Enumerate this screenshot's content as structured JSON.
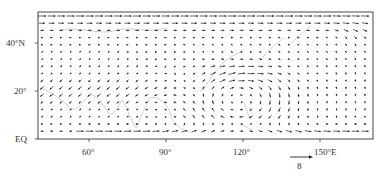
{
  "figure": {
    "type": "wind_vector_field_map",
    "frame": {
      "lon_min": 40,
      "lon_max": 170,
      "lat_min": 0,
      "lat_max": 53
    },
    "colors": {
      "vectors": "#222222",
      "coastline": "#b8b8b8",
      "frame": "#333333"
    }
  },
  "axes": {
    "y_ticks": [
      {
        "label": "40°N",
        "lat": 40
      },
      {
        "label": "20°",
        "lat": 20
      },
      {
        "label": "EQ",
        "lat": 0
      }
    ],
    "x_ticks": [
      {
        "label": "60°",
        "lon": 60
      },
      {
        "label": "90°",
        "lon": 90
      },
      {
        "label": "120°",
        "lon": 120
      },
      {
        "label": "150°E",
        "lon": 150
      }
    ]
  },
  "scale_vector": {
    "label": "8",
    "icon": "reference-arrow"
  },
  "chart_data": {
    "type": "quiver",
    "title": "",
    "xlabel": "Longitude",
    "ylabel": "Latitude",
    "xlim": [
      40,
      170
    ],
    "ylim": [
      0,
      53
    ],
    "x_ticks": [
      "60°",
      "90°",
      "120°",
      "150°E"
    ],
    "y_ticks": [
      "EQ",
      "20°",
      "40°N"
    ],
    "reference_vector": 8,
    "features": [
      {
        "name": "westerly jet",
        "region": "lat 45-53, all lon",
        "direction": "eastward",
        "magnitude": "strong"
      },
      {
        "name": "northeasterly flow",
        "region": "lat 15-30, lon 40-90",
        "direction": "southwestward",
        "magnitude": "moderate"
      },
      {
        "name": "anticyclonic gyre",
        "region": "lat 5-30, lon 95-160, centered ~118E 15N",
        "direction": "clockwise",
        "magnitude": "moderate"
      },
      {
        "name": "equatorial westerlies",
        "region": "lat 0-8, lon 60-160",
        "direction": "eastward",
        "magnitude": "strong"
      },
      {
        "name": "weak mid-latitude flow",
        "region": "lat 25-42, lon 50-130",
        "direction": "variable",
        "magnitude": "weak"
      }
    ]
  }
}
